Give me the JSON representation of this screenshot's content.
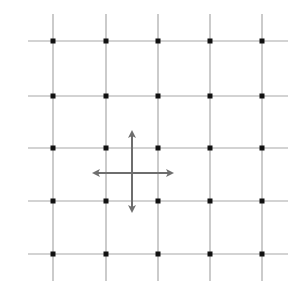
{
  "diagram": {
    "type": "lattice-grid",
    "rows": 5,
    "cols": 5,
    "x_positions": [
      53,
      106,
      158,
      210,
      262
    ],
    "y_positions": [
      41,
      96,
      148,
      201,
      254
    ],
    "h_line_extent": [
      28,
      288
    ],
    "v_line_extent": [
      14,
      281
    ],
    "colors": {
      "grid_line": "#a8a8a8",
      "node": "#111111",
      "arrow": "#6e6e6e",
      "background": "#ffffff"
    },
    "cross_arrows": {
      "center": [
        132,
        173
      ],
      "horizontal": {
        "x1": 92,
        "x2": 174,
        "y": 173
      },
      "vertical": {
        "y1": 130,
        "y2": 213,
        "x": 132
      },
      "label": "four-direction movement arrows"
    }
  }
}
